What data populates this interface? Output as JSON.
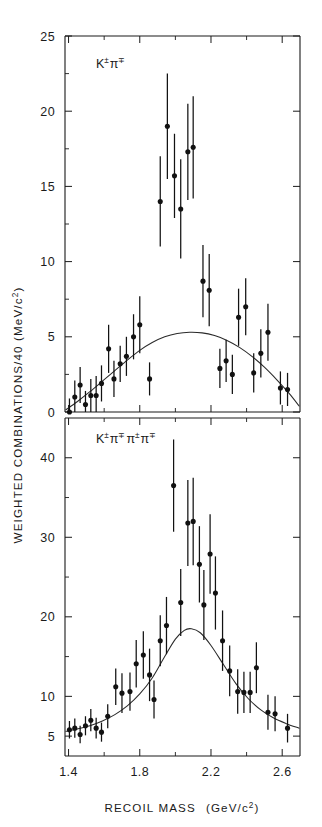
{
  "figure": {
    "background_color": "#ffffff",
    "ink_color": "#1b1b1b"
  },
  "axes": {
    "y_axis_title": "WEIGHTED COMBINATIONS/40  (MeV/c²)",
    "y_axis_title_parts": {
      "main": "WEIGHTED COMBINATIONS/40  (MeV/c",
      "exponent": "2",
      "close": ")"
    },
    "x_axis_title": "RECOIL MASS",
    "x_axis_units_main": "(GeV/c",
    "x_axis_units_exponent": "2",
    "x_axis_units_close": ")",
    "x_tick_labels": [
      "1.4",
      "1.8",
      "2.2",
      "2.6"
    ],
    "x_tick_values": [
      1.4,
      1.8,
      2.2,
      2.6
    ],
    "x_minor_step": 0.1,
    "x_range": [
      1.38,
      2.7
    ]
  },
  "chart_data": [
    {
      "type": "scatter",
      "panel": "top",
      "title": "K± π∓ recoil mass spectrum",
      "label_parts": {
        "k": "K",
        "k_sup": "±",
        "pi": "π",
        "pi_sup": "∓"
      },
      "xlabel": "RECOIL MASS  (GeV/c²)",
      "ylabel": "WEIGHTED COMBINATIONS/40 (MeV/c²)",
      "ylim": [
        0,
        25
      ],
      "y_tick_labels": [
        "0",
        "5",
        "10",
        "15",
        "20",
        "25"
      ],
      "y_tick_values": [
        0,
        5,
        10,
        15,
        20,
        25
      ],
      "y_minor_step": 2.5,
      "grid": false,
      "legend": "none",
      "error_bar_style": "vertical-1sigma",
      "points": [
        {
          "x": 1.405,
          "y": 0.0,
          "err": 0.9
        },
        {
          "x": 1.435,
          "y": 1.0,
          "err": 1.1
        },
        {
          "x": 1.465,
          "y": 1.8,
          "err": 1.2
        },
        {
          "x": 1.495,
          "y": 0.5,
          "err": 0.9
        },
        {
          "x": 1.525,
          "y": 1.1,
          "err": 1.1
        },
        {
          "x": 1.555,
          "y": 1.1,
          "err": 1.3
        },
        {
          "x": 1.585,
          "y": 1.9,
          "err": 1.2
        },
        {
          "x": 1.625,
          "y": 4.2,
          "err": 1.6
        },
        {
          "x": 1.655,
          "y": 2.2,
          "err": 1.2
        },
        {
          "x": 1.69,
          "y": 3.2,
          "err": 1.2
        },
        {
          "x": 1.725,
          "y": 3.7,
          "err": 1.3
        },
        {
          "x": 1.765,
          "y": 5.0,
          "err": 1.5
        },
        {
          "x": 1.8,
          "y": 5.8,
          "err": 1.9
        },
        {
          "x": 1.855,
          "y": 2.2,
          "err": 1.1
        },
        {
          "x": 1.915,
          "y": 14.0,
          "err": 3.0
        },
        {
          "x": 1.955,
          "y": 19.0,
          "err": 3.5
        },
        {
          "x": 1.995,
          "y": 15.7,
          "err": 2.8
        },
        {
          "x": 2.03,
          "y": 13.5,
          "err": 3.3
        },
        {
          "x": 2.07,
          "y": 17.3,
          "err": 3.2
        },
        {
          "x": 2.1,
          "y": 17.6,
          "err": 3.4
        },
        {
          "x": 2.155,
          "y": 8.7,
          "err": 2.4
        },
        {
          "x": 2.19,
          "y": 8.1,
          "err": 2.4
        },
        {
          "x": 2.25,
          "y": 2.9,
          "err": 1.3
        },
        {
          "x": 2.285,
          "y": 3.4,
          "err": 1.4
        },
        {
          "x": 2.32,
          "y": 2.5,
          "err": 1.3
        },
        {
          "x": 2.355,
          "y": 6.3,
          "err": 1.9
        },
        {
          "x": 2.395,
          "y": 7.0,
          "err": 1.9
        },
        {
          "x": 2.44,
          "y": 2.6,
          "err": 1.3
        },
        {
          "x": 2.48,
          "y": 3.9,
          "err": 1.6
        },
        {
          "x": 2.52,
          "y": 5.3,
          "err": 1.9
        },
        {
          "x": 2.59,
          "y": 1.6,
          "err": 1.1
        },
        {
          "x": 2.63,
          "y": 1.5,
          "err": 1.1
        }
      ],
      "fit_curve": {
        "description": "smooth background curve peaking near 2.15 GeV/c² at ~5.3",
        "x": [
          1.385,
          1.45,
          1.52,
          1.59,
          1.66,
          1.73,
          1.8,
          1.87,
          1.94,
          2.01,
          2.08,
          2.15,
          2.22,
          2.29,
          2.36,
          2.43,
          2.5,
          2.57,
          2.64,
          2.695
        ],
        "y": [
          0.15,
          0.7,
          1.35,
          2.05,
          2.75,
          3.45,
          4.1,
          4.62,
          5.0,
          5.22,
          5.3,
          5.26,
          5.08,
          4.76,
          4.3,
          3.7,
          2.98,
          2.14,
          1.22,
          0.4
        ]
      }
    },
    {
      "type": "scatter",
      "panel": "bottom",
      "title": "K± π∓ π± π∓ recoil mass spectrum",
      "label_parts": {
        "k": "K",
        "k_sup": "±",
        "pi1": "π",
        "pi1_sup": "∓",
        "pi2": "π",
        "pi2_sup": "±",
        "pi3": "π",
        "pi3_sup": "∓"
      },
      "xlabel": "RECOIL MASS  (GeV/c²)",
      "ylabel": "WEIGHTED COMBINATIONS/40 (MeV/c²)",
      "ylim": [
        2.5,
        45
      ],
      "y_tick_labels": [
        "5",
        "10",
        "20",
        "30",
        "40"
      ],
      "y_tick_values": [
        5,
        10,
        20,
        30,
        40
      ],
      "y_minor_step": 5,
      "grid": false,
      "legend": "none",
      "error_bar_style": "vertical-1sigma",
      "points": [
        {
          "x": 1.405,
          "y": 5.8,
          "err": 1.1
        },
        {
          "x": 1.435,
          "y": 6.0,
          "err": 1.2
        },
        {
          "x": 1.465,
          "y": 5.2,
          "err": 1.1
        },
        {
          "x": 1.495,
          "y": 6.3,
          "err": 1.2
        },
        {
          "x": 1.525,
          "y": 7.0,
          "err": 1.4
        },
        {
          "x": 1.555,
          "y": 6.0,
          "err": 1.3
        },
        {
          "x": 1.585,
          "y": 5.5,
          "err": 1.2
        },
        {
          "x": 1.62,
          "y": 7.5,
          "err": 1.5
        },
        {
          "x": 1.665,
          "y": 11.2,
          "err": 2.3
        },
        {
          "x": 1.7,
          "y": 10.4,
          "err": 2.5
        },
        {
          "x": 1.745,
          "y": 10.6,
          "err": 2.4
        },
        {
          "x": 1.78,
          "y": 14.1,
          "err": 3.0
        },
        {
          "x": 1.82,
          "y": 15.2,
          "err": 3.0
        },
        {
          "x": 1.855,
          "y": 12.7,
          "err": 3.3
        },
        {
          "x": 1.88,
          "y": 9.6,
          "err": 2.4
        },
        {
          "x": 1.915,
          "y": 17.0,
          "err": 3.2
        },
        {
          "x": 1.95,
          "y": 18.9,
          "err": 3.6
        },
        {
          "x": 1.99,
          "y": 36.5,
          "err": 5.8
        },
        {
          "x": 2.03,
          "y": 21.8,
          "err": 4.2
        },
        {
          "x": 2.07,
          "y": 31.8,
          "err": 5.4
        },
        {
          "x": 2.1,
          "y": 32.0,
          "err": 5.5
        },
        {
          "x": 2.135,
          "y": 26.6,
          "err": 4.8
        },
        {
          "x": 2.16,
          "y": 21.5,
          "err": 4.4
        },
        {
          "x": 2.195,
          "y": 27.9,
          "err": 5.0
        },
        {
          "x": 2.225,
          "y": 23.0,
          "err": 4.6
        },
        {
          "x": 2.265,
          "y": 17.0,
          "err": 3.8
        },
        {
          "x": 2.305,
          "y": 13.2,
          "err": 3.2
        },
        {
          "x": 2.35,
          "y": 10.6,
          "err": 2.8
        },
        {
          "x": 2.385,
          "y": 10.5,
          "err": 2.6
        },
        {
          "x": 2.42,
          "y": 10.5,
          "err": 2.6
        },
        {
          "x": 2.455,
          "y": 13.6,
          "err": 3.2
        },
        {
          "x": 2.52,
          "y": 8.0,
          "err": 2.2
        },
        {
          "x": 2.56,
          "y": 7.8,
          "err": 2.2
        },
        {
          "x": 2.63,
          "y": 6.0,
          "err": 1.8
        }
      ],
      "fit_curve": {
        "description": "resonance-shaped curve peaking near 2.08 GeV/c² at ~18.5",
        "x": [
          1.385,
          1.45,
          1.52,
          1.59,
          1.66,
          1.73,
          1.8,
          1.87,
          1.94,
          2.0,
          2.05,
          2.09,
          2.14,
          2.2,
          2.27,
          2.34,
          2.41,
          2.48,
          2.55,
          2.62,
          2.695
        ],
        "y": [
          5.6,
          5.9,
          6.3,
          6.9,
          7.7,
          8.8,
          10.3,
          12.3,
          15.0,
          17.2,
          18.3,
          18.5,
          18.0,
          16.4,
          14.0,
          11.6,
          9.7,
          8.3,
          7.3,
          6.6,
          6.0
        ]
      }
    }
  ]
}
